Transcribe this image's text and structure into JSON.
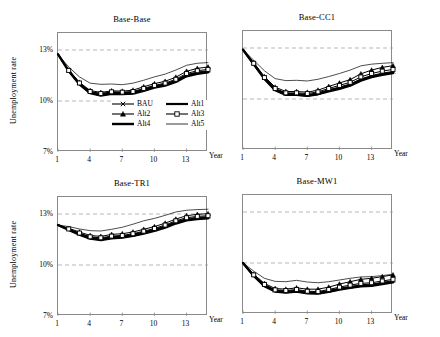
{
  "figure": {
    "shared_ylabel": "Unemployment rate",
    "shared_xlabel": "Year",
    "yticks": [
      "7%",
      "10%",
      "13%"
    ],
    "ytick_values": [
      7,
      10,
      13
    ],
    "xticks": [
      "1",
      "4",
      "7",
      "10",
      "13"
    ],
    "xtick_values": [
      1,
      4,
      7,
      10,
      13
    ],
    "legend": {
      "entries": [
        {
          "name": "BAU",
          "marker": "x",
          "color": "#000000",
          "width": 1.1
        },
        {
          "name": "Alt1",
          "marker": "none",
          "color": "#000000",
          "width": 2.2
        },
        {
          "name": "Alt2",
          "marker": "triangle",
          "color": "#000000",
          "width": 1.1
        },
        {
          "name": "Alt3",
          "marker": "square",
          "color": "#000000",
          "width": 1.1
        },
        {
          "name": "Alt4",
          "marker": "none",
          "color": "#000000",
          "width": 2.4
        },
        {
          "name": "Alt5",
          "marker": "none",
          "color": "#000000",
          "width": 0.8
        }
      ],
      "position": "inside-bottom-right-of-panel-1"
    },
    "gridlines": {
      "y": [
        10,
        13
      ],
      "style": "dashed",
      "color": "#9a9a9a"
    },
    "axis_color": "#8a8a8a",
    "background": "#ffffff"
  },
  "chart_data": [
    {
      "type": "line",
      "title": "Base-Base",
      "xlabel": "Year",
      "ylabel": "Unemployment rate",
      "xlim": [
        1,
        15
      ],
      "ylim": [
        7,
        14
      ],
      "yticks": [
        7,
        10,
        13
      ],
      "xticks": [
        1,
        4,
        7,
        10,
        13
      ],
      "grid": true,
      "x": [
        1,
        2,
        3,
        4,
        5,
        6,
        7,
        8,
        9,
        10,
        11,
        12,
        13,
        14,
        15
      ],
      "series": [
        {
          "name": "BAU",
          "values": [
            12.75,
            11.8,
            11.05,
            10.55,
            10.42,
            10.52,
            10.48,
            10.52,
            10.7,
            10.88,
            11.0,
            11.22,
            11.55,
            11.7,
            11.78
          ]
        },
        {
          "name": "Alt1",
          "values": [
            12.75,
            11.78,
            11.0,
            10.48,
            10.35,
            10.45,
            10.42,
            10.46,
            10.64,
            10.82,
            10.95,
            11.18,
            11.5,
            11.65,
            11.72
          ]
        },
        {
          "name": "Alt2",
          "values": [
            12.75,
            11.82,
            11.1,
            10.62,
            10.5,
            10.6,
            10.58,
            10.64,
            10.84,
            11.02,
            11.16,
            11.4,
            11.75,
            11.92,
            12.0
          ]
        },
        {
          "name": "Alt3",
          "values": [
            12.75,
            11.8,
            11.06,
            10.56,
            10.44,
            10.54,
            10.52,
            10.56,
            10.74,
            10.92,
            11.05,
            11.28,
            11.62,
            11.78,
            11.86
          ]
        },
        {
          "name": "Alt4",
          "values": [
            12.75,
            11.76,
            10.98,
            10.46,
            10.32,
            10.42,
            10.4,
            10.44,
            10.6,
            10.78,
            10.9,
            11.12,
            11.45,
            11.6,
            11.68
          ]
        },
        {
          "name": "Alt5",
          "values": [
            12.75,
            12.0,
            11.42,
            11.05,
            10.98,
            11.0,
            10.96,
            11.05,
            11.22,
            11.42,
            11.58,
            11.82,
            12.1,
            12.22,
            12.26
          ]
        }
      ]
    },
    {
      "type": "line",
      "title": "Base-CC1",
      "xlabel": "Year",
      "ylabel": "Unemployment rate",
      "xlim": [
        1,
        15
      ],
      "ylim": [
        7,
        14
      ],
      "yticks": [
        7,
        10,
        13
      ],
      "xticks": [
        1,
        4,
        7,
        10,
        13
      ],
      "grid": true,
      "x": [
        1,
        2,
        3,
        4,
        5,
        6,
        7,
        8,
        9,
        10,
        11,
        12,
        13,
        14,
        15
      ],
      "series": [
        {
          "name": "BAU",
          "values": [
            12.9,
            12.1,
            11.25,
            10.6,
            10.32,
            10.32,
            10.26,
            10.36,
            10.55,
            10.7,
            10.88,
            11.18,
            11.38,
            11.52,
            11.62
          ]
        },
        {
          "name": "Alt1",
          "values": [
            12.9,
            12.06,
            11.2,
            10.54,
            10.26,
            10.26,
            10.2,
            10.3,
            10.48,
            10.64,
            10.82,
            11.12,
            11.32,
            11.46,
            11.56
          ]
        },
        {
          "name": "Alt2",
          "values": [
            12.9,
            12.14,
            11.32,
            10.7,
            10.44,
            10.44,
            10.4,
            10.52,
            10.74,
            10.94,
            11.14,
            11.48,
            11.7,
            11.86,
            11.96
          ]
        },
        {
          "name": "Alt3",
          "values": [
            12.9,
            12.1,
            11.26,
            10.62,
            10.36,
            10.36,
            10.32,
            10.42,
            10.62,
            10.8,
            10.98,
            11.3,
            11.5,
            11.64,
            11.74
          ]
        },
        {
          "name": "Alt4",
          "values": [
            12.9,
            12.04,
            11.18,
            10.52,
            10.24,
            10.24,
            10.18,
            10.28,
            10.45,
            10.6,
            10.78,
            11.08,
            11.28,
            11.42,
            11.52
          ]
        },
        {
          "name": "Alt5",
          "values": [
            12.9,
            12.28,
            11.66,
            11.2,
            11.08,
            11.1,
            11.06,
            11.16,
            11.32,
            11.5,
            11.7,
            11.95,
            12.05,
            12.1,
            12.14
          ]
        }
      ]
    },
    {
      "type": "line",
      "title": "Base-TR1",
      "xlabel": "Year",
      "ylabel": "Unemployment rate",
      "xlim": [
        1,
        15
      ],
      "ylim": [
        7,
        14
      ],
      "yticks": [
        7,
        10,
        13
      ],
      "xticks": [
        1,
        4,
        7,
        10,
        13
      ],
      "grid": true,
      "x": [
        1,
        2,
        3,
        4,
        5,
        6,
        7,
        8,
        9,
        10,
        11,
        12,
        13,
        14,
        15
      ],
      "series": [
        {
          "name": "BAU",
          "values": [
            12.35,
            12.12,
            11.86,
            11.64,
            11.56,
            11.66,
            11.7,
            11.8,
            11.95,
            12.1,
            12.3,
            12.55,
            12.72,
            12.8,
            12.84
          ]
        },
        {
          "name": "Alt1",
          "values": [
            12.35,
            12.08,
            11.8,
            11.58,
            11.5,
            11.6,
            11.64,
            11.74,
            11.88,
            12.04,
            12.24,
            12.48,
            12.66,
            12.74,
            12.78
          ]
        },
        {
          "name": "Alt2",
          "values": [
            12.35,
            12.16,
            11.94,
            11.74,
            11.68,
            11.8,
            11.84,
            11.94,
            12.1,
            12.26,
            12.46,
            12.7,
            12.9,
            12.98,
            13.02
          ]
        },
        {
          "name": "Alt3",
          "values": [
            12.35,
            12.12,
            11.88,
            11.66,
            11.6,
            11.7,
            11.74,
            11.84,
            11.99,
            12.15,
            12.35,
            12.6,
            12.78,
            12.86,
            12.9
          ]
        },
        {
          "name": "Alt4",
          "values": [
            12.35,
            12.06,
            11.78,
            11.55,
            11.47,
            11.57,
            11.61,
            11.71,
            11.85,
            12.0,
            12.2,
            12.44,
            12.62,
            12.7,
            12.74
          ]
        },
        {
          "name": "Alt5",
          "values": [
            12.35,
            12.26,
            12.12,
            12.02,
            12.0,
            12.1,
            12.22,
            12.4,
            12.6,
            12.74,
            12.92,
            13.12,
            13.22,
            13.26,
            13.28
          ]
        }
      ]
    },
    {
      "type": "line",
      "title": "Base-MW1",
      "xlabel": "Year",
      "ylabel": "Unemployment rate",
      "xlim": [
        1,
        15
      ],
      "ylim": [
        7,
        14
      ],
      "yticks": [
        7,
        10,
        13
      ],
      "xticks": [
        1,
        4,
        7,
        10,
        13
      ],
      "grid": true,
      "x": [
        1,
        2,
        3,
        4,
        5,
        6,
        7,
        8,
        9,
        10,
        11,
        12,
        13,
        14,
        15
      ],
      "series": [
        {
          "name": "BAU",
          "values": [
            10.0,
            9.3,
            8.72,
            8.4,
            8.34,
            8.4,
            8.3,
            8.28,
            8.38,
            8.52,
            8.62,
            8.72,
            8.76,
            8.86,
            8.96
          ]
        },
        {
          "name": "Alt1",
          "values": [
            10.0,
            9.26,
            8.66,
            8.34,
            8.28,
            8.34,
            8.24,
            8.22,
            8.32,
            8.46,
            8.56,
            8.66,
            8.7,
            8.8,
            8.9
          ]
        },
        {
          "name": "Alt2",
          "values": [
            10.0,
            9.34,
            8.8,
            8.5,
            8.46,
            8.54,
            8.46,
            8.46,
            8.58,
            8.76,
            8.9,
            9.04,
            9.1,
            9.2,
            9.3
          ]
        },
        {
          "name": "Alt3",
          "values": [
            10.0,
            9.3,
            8.74,
            8.42,
            8.38,
            8.44,
            8.34,
            8.32,
            8.44,
            8.58,
            8.7,
            8.8,
            8.84,
            8.94,
            9.04
          ]
        },
        {
          "name": "Alt4",
          "values": [
            10.0,
            9.24,
            8.64,
            8.32,
            8.26,
            8.32,
            8.22,
            8.2,
            8.3,
            8.44,
            8.54,
            8.62,
            8.66,
            8.76,
            8.86
          ]
        },
        {
          "name": "Alt5",
          "values": [
            10.0,
            9.52,
            9.1,
            8.92,
            8.9,
            8.98,
            8.88,
            8.84,
            8.9,
            9.0,
            9.1,
            9.18,
            9.2,
            9.26,
            9.34
          ]
        }
      ]
    }
  ]
}
